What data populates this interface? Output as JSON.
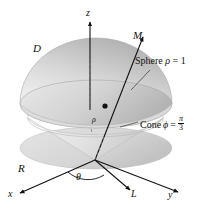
{
  "figure": {
    "background_color": "#ffffff",
    "ink_color": "#111111",
    "surface_light": "#e6e6e6",
    "surface_mid": "#cfcfcf",
    "surface_dark": "#b0b0b0"
  },
  "axes": {
    "z_label": "z",
    "x_label": "x",
    "y_label": "y"
  },
  "labels": {
    "solid_region": "D",
    "projection_region": "R",
    "ray_M": "M",
    "ray_L": "L",
    "angle_theta": "θ",
    "radius_rho": "ρ"
  },
  "annotations": {
    "sphere": {
      "text_prefix": "Sphere ",
      "symbol": "ρ",
      "equals": " = 1"
    },
    "cone": {
      "text_prefix": "Cone ",
      "symbol": "ϕ",
      "equals": " = ",
      "fraction_numerator": "π",
      "fraction_denominator": "3"
    }
  }
}
